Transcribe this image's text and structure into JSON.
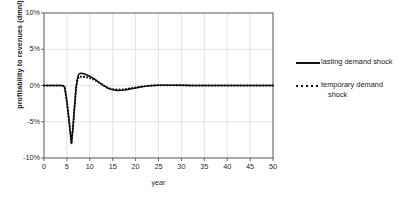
{
  "chart_data": {
    "type": "line",
    "title": "",
    "xlabel": "year",
    "ylabel": "profitability to revenues (dmnl)",
    "xlim": [
      0,
      50
    ],
    "ylim": [
      -0.1,
      0.1
    ],
    "xticks": [
      0,
      5,
      10,
      15,
      20,
      25,
      30,
      35,
      40,
      45,
      50
    ],
    "xtick_labels": [
      "0",
      "5",
      "10",
      "15",
      "20",
      "25",
      "30",
      "35",
      "40",
      "45",
      "50"
    ],
    "yticks": [
      -0.1,
      -0.05,
      0.0,
      0.05,
      0.1
    ],
    "ytick_labels": [
      "-10%",
      "-5%",
      "0%",
      "5%",
      "10%"
    ],
    "grid": true,
    "grid_color": "#d9d9d9",
    "legend_position": "right",
    "line_color": "#111111",
    "series": [
      {
        "name": "lasting demand shock",
        "style": "solid",
        "x": [
          0,
          1,
          2,
          3,
          4,
          4.5,
          5,
          5.5,
          6,
          6.3,
          6.6,
          7,
          7.3,
          7.6,
          8,
          8.5,
          9,
          9.5,
          10,
          10.5,
          11,
          11.5,
          12,
          12.5,
          13,
          13.5,
          14,
          15,
          16,
          17,
          18,
          19,
          20,
          21,
          22,
          23,
          24,
          25,
          26,
          27,
          28,
          29,
          30,
          32,
          34,
          36,
          38,
          40,
          42,
          44,
          46,
          48,
          50
        ],
        "y": [
          0.0,
          0.0,
          0.0,
          0.0,
          0.0,
          -0.002,
          -0.022,
          -0.05,
          -0.08,
          -0.06,
          -0.035,
          -0.003,
          0.01,
          0.016,
          0.017,
          0.0165,
          0.0155,
          0.0142,
          0.0128,
          0.011,
          0.009,
          0.0068,
          0.0045,
          0.0022,
          0.0,
          -0.002,
          -0.0038,
          -0.006,
          -0.0068,
          -0.0066,
          -0.0058,
          -0.0046,
          -0.0034,
          -0.0022,
          -0.0012,
          -0.0004,
          0.0001,
          0.0004,
          0.0005,
          0.0005,
          0.0004,
          0.0003,
          0.0002,
          0.0001,
          0.0001,
          0.0,
          0.0,
          0.0,
          0.0,
          0.0,
          0.0,
          0.0,
          0.0
        ]
      },
      {
        "name": "temporary demand shock",
        "style": "dotted",
        "x": [
          0,
          1,
          2,
          3,
          4,
          4.5,
          5,
          5.5,
          6,
          6.3,
          6.6,
          7,
          7.3,
          7.6,
          8,
          8.5,
          9,
          9.5,
          10,
          10.5,
          11,
          11.5,
          12,
          12.5,
          13,
          13.5,
          14,
          15,
          16,
          17,
          18,
          19,
          20,
          21,
          22,
          23,
          24,
          25,
          26,
          27,
          28,
          29,
          30,
          32,
          34,
          36,
          38,
          40,
          42,
          44,
          46,
          48,
          50
        ],
        "y": [
          0.0,
          0.0,
          0.0,
          0.0,
          0.0,
          -0.002,
          -0.022,
          -0.05,
          -0.08,
          -0.06,
          -0.035,
          -0.004,
          0.008,
          0.0118,
          0.012,
          0.012,
          0.0118,
          0.0112,
          0.0104,
          0.0092,
          0.0078,
          0.006,
          0.004,
          0.002,
          0.0,
          -0.0018,
          -0.0034,
          -0.0052,
          -0.0058,
          -0.0056,
          -0.0049,
          -0.0039,
          -0.0029,
          -0.0019,
          -0.001,
          -0.0003,
          0.0001,
          0.0003,
          0.0004,
          0.0004,
          0.0003,
          0.0002,
          0.0002,
          0.0001,
          0.0,
          0.0,
          0.0,
          0.0,
          0.0,
          0.0,
          0.0,
          0.0,
          0.0
        ]
      }
    ]
  },
  "axes": {
    "y_title": "profitability to revenues (dmnl)",
    "x_title": "year"
  },
  "legend": {
    "items": [
      {
        "label": "lasting demand shock",
        "label_line2": "",
        "style": "solid"
      },
      {
        "label": "temporary demand",
        "label_line2": "shock",
        "style": "dotted"
      }
    ]
  }
}
